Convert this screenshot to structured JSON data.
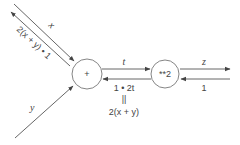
{
  "diagram": {
    "type": "computational-graph",
    "nodes": [
      {
        "id": "add",
        "label": "+"
      },
      {
        "id": "square",
        "label": "**2"
      }
    ],
    "edges": {
      "x_forward": {
        "label": "x"
      },
      "x_backward": {
        "label": "2(x + y) • 1"
      },
      "y_forward": {
        "label": "y"
      },
      "t_forward": {
        "label": "t"
      },
      "t_backward": {
        "label": "1 • 2t"
      },
      "z_forward": {
        "label": "z"
      },
      "z_backward": {
        "label": "1"
      }
    },
    "annotation": {
      "equals": "||",
      "expression": "2(x + y)"
    },
    "colors": {
      "line": "#555555",
      "node_border": "#777777",
      "text": "#444444"
    }
  }
}
